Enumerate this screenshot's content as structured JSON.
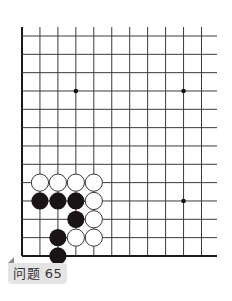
{
  "caption": "问题 65",
  "board": {
    "columns": 11,
    "rows": 13,
    "edges": [
      "left",
      "bottom"
    ],
    "star_points": [
      {
        "col": 3,
        "row": 3
      },
      {
        "col": 9,
        "row": 3
      },
      {
        "col": 9,
        "row": 9
      }
    ],
    "stones": [
      {
        "color": "white",
        "col": 1,
        "row": 8
      },
      {
        "color": "white",
        "col": 2,
        "row": 8
      },
      {
        "color": "white",
        "col": 3,
        "row": 8
      },
      {
        "color": "white",
        "col": 4,
        "row": 8
      },
      {
        "color": "black",
        "col": 1,
        "row": 9
      },
      {
        "color": "black",
        "col": 2,
        "row": 9
      },
      {
        "color": "black",
        "col": 3,
        "row": 9
      },
      {
        "color": "white",
        "col": 4,
        "row": 9
      },
      {
        "color": "black",
        "col": 3,
        "row": 10
      },
      {
        "color": "white",
        "col": 4,
        "row": 10
      },
      {
        "color": "black",
        "col": 2,
        "row": 11
      },
      {
        "color": "white",
        "col": 3,
        "row": 11
      },
      {
        "color": "white",
        "col": 4,
        "row": 11
      },
      {
        "color": "black",
        "col": 2,
        "row": 12
      }
    ],
    "colors": {
      "line": "#3a3a3a",
      "edge": "#1a1a1a",
      "black_stone": "#1b1416",
      "white_stone": "#ffffff"
    }
  }
}
